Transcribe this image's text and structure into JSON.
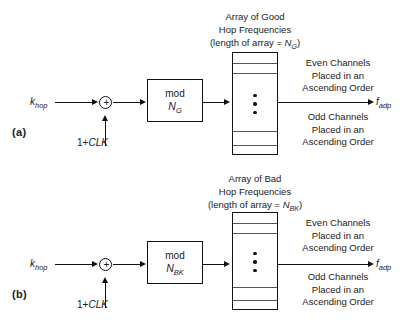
{
  "figure": {
    "panels": [
      {
        "letter": "(a)",
        "input_label": "k",
        "input_sub": "hop",
        "clock_label_pre": "1+",
        "clock_label_it": "CLK",
        "sum_symbol": "+",
        "mod_label": "mod",
        "mod_operand": "N",
        "mod_operand_sub": "G",
        "array_caption_line1": "Array of Good",
        "array_caption_line2": "Hop Frequencies",
        "array_caption_line3_pre": "(length of array = ",
        "array_caption_line3_var": "N",
        "array_caption_line3_sub": "G",
        "array_caption_line3_post": ")",
        "note_even_line1": "Even Channels",
        "note_even_line2": "Placed in an",
        "note_even_line3": "Ascending Order",
        "note_odd_line1": "Odd Channels",
        "note_odd_line2": "Placed in an",
        "note_odd_line3": "Ascending Order",
        "output_label": "f",
        "output_sub": "adp",
        "array_row_lines_y": [
          10,
          20,
          78,
          92
        ]
      },
      {
        "letter": "(b)",
        "input_label": "k",
        "input_sub": "hop",
        "clock_label_pre": "1+",
        "clock_label_it": "CLK",
        "sum_symbol": "+",
        "mod_label": "mod",
        "mod_operand": "N",
        "mod_operand_sub": "BK",
        "array_caption_line1": "Array of Bad",
        "array_caption_line2": "Hop Frequencies",
        "array_caption_line3_pre": "(length of array = ",
        "array_caption_line3_var": "N",
        "array_caption_line3_sub": "BK",
        "array_caption_line3_post": ")",
        "note_even_line1": "Even Channels",
        "note_even_line2": "Placed in an",
        "note_even_line3": "Ascending Order",
        "note_odd_line1": "Odd Channels",
        "note_odd_line2": "Placed in an",
        "note_odd_line3": "Ascending Order",
        "output_label": "f",
        "output_sub": "adp",
        "array_row_lines_y": [
          10,
          20,
          78,
          92
        ]
      }
    ],
    "colors": {
      "line": "#111111",
      "row_line": "#555555",
      "background": "#ffffff"
    }
  }
}
